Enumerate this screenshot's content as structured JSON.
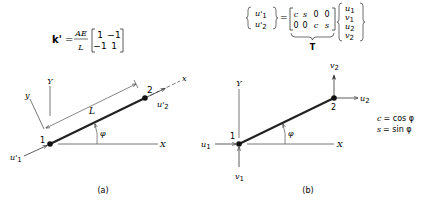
{
  "panel_a": {
    "equation": {
      "lhs": "k'",
      "equals": "=",
      "fraction_num": "AE",
      "fraction_den": "L",
      "matrix": [
        [
          "1",
          "−1"
        ],
        [
          "−1",
          "1"
        ]
      ]
    },
    "labels": {
      "node1": "1",
      "node2": "2",
      "global_x": "X",
      "global_y": "Y",
      "local_x": "x",
      "local_y": "y",
      "length": "L",
      "angle": "φ",
      "u1_prime": "u'",
      "u1_sub": "1",
      "u2_prime": "u'",
      "u2_sub": "2"
    },
    "caption": "(a)"
  },
  "panel_b": {
    "equation": {
      "lhs": [
        {
          "base": "u'",
          "sub": "1"
        },
        {
          "base": "u'",
          "sub": "2"
        }
      ],
      "equals": "=",
      "matrix": [
        [
          "c",
          "s",
          "0",
          "0"
        ],
        [
          "0",
          "0",
          "c",
          "s"
        ]
      ],
      "underbrace_label": "T",
      "rhs": [
        {
          "base": "u",
          "sub": "1"
        },
        {
          "base": "v",
          "sub": "1"
        },
        {
          "base": "u",
          "sub": "2"
        },
        {
          "base": "v",
          "sub": "2"
        }
      ]
    },
    "labels": {
      "node1": "1",
      "node2": "2",
      "global_x": "X",
      "global_y": "Y",
      "angle": "φ",
      "u1": "u",
      "u1_sub": "1",
      "v1": "v",
      "v1_sub": "1",
      "u2": "u",
      "u2_sub": "2",
      "v2": "v",
      "v2_sub": "2"
    },
    "definitions": {
      "c_def_lhs": "c",
      "c_def_rhs": "= cos φ",
      "s_def_lhs": "s",
      "s_def_rhs": "= sin φ"
    },
    "caption": "(b)"
  }
}
